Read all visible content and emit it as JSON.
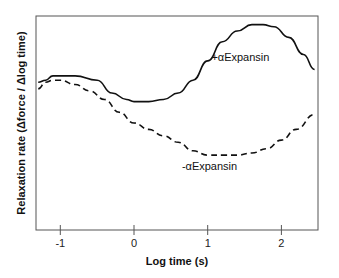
{
  "chart_data": {
    "type": "line",
    "title": "",
    "xlabel": "Log time (s)",
    "ylabel": "Relaxation rate (Δforce / Δlog time)",
    "xlim": [
      -1.33,
      2.5
    ],
    "ylim": [
      0,
      1
    ],
    "x_ticks": [
      "-1",
      "0",
      "1",
      "2"
    ],
    "y_ticks": [],
    "grid": false,
    "legend": "none",
    "series": [
      {
        "name": "+αExpansin",
        "style": "solid",
        "x": [
          -1.3,
          -1.2,
          -1.1,
          -1.0,
          -0.8,
          -0.5,
          -0.3,
          -0.1,
          0.0,
          0.2,
          0.4,
          0.6,
          0.8,
          1.0,
          1.2,
          1.4,
          1.6,
          1.75,
          1.9,
          2.1,
          2.3,
          2.45
        ],
        "y": [
          0.69,
          0.7,
          0.72,
          0.72,
          0.72,
          0.7,
          0.64,
          0.61,
          0.6,
          0.6,
          0.61,
          0.64,
          0.7,
          0.79,
          0.88,
          0.93,
          0.96,
          0.96,
          0.95,
          0.9,
          0.82,
          0.75
        ]
      },
      {
        "name": "-αExpansin",
        "style": "dashed",
        "x": [
          -1.3,
          -1.2,
          -1.1,
          -1.0,
          -0.8,
          -0.6,
          -0.4,
          -0.2,
          0.0,
          0.2,
          0.4,
          0.6,
          0.8,
          1.0,
          1.2,
          1.4,
          1.6,
          1.8,
          2.0,
          2.2,
          2.45
        ],
        "y": [
          0.66,
          0.69,
          0.7,
          0.7,
          0.68,
          0.65,
          0.61,
          0.55,
          0.5,
          0.47,
          0.44,
          0.41,
          0.37,
          0.35,
          0.35,
          0.35,
          0.36,
          0.38,
          0.42,
          0.47,
          0.54
        ]
      }
    ],
    "annotations": [
      {
        "text": "+αExpansin",
        "x": 1.05,
        "y": 0.79
      },
      {
        "text": "-αExpansin",
        "x": 0.65,
        "y": 0.28
      }
    ]
  }
}
